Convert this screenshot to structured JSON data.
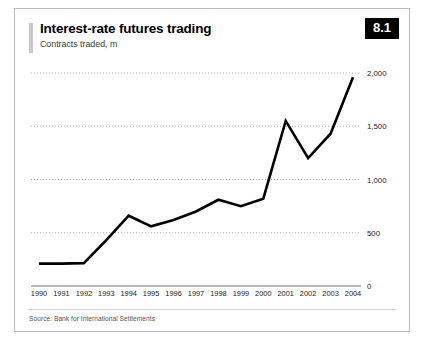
{
  "figure": {
    "badge": "8.1",
    "title": "Interest-rate futures trading",
    "subtitle": "Contracts traded, m",
    "source": "Source: Bank for International Settlements"
  },
  "chart_data": {
    "type": "line",
    "title": "Interest-rate futures trading",
    "subtitle": "Contracts traded, m",
    "xlabel": "",
    "ylabel": "Contracts traded, m",
    "ylim": [
      0,
      2000
    ],
    "yticks": [
      0,
      500,
      1000,
      1500,
      2000
    ],
    "ytick_labels": [
      "0",
      "500",
      "1,000",
      "1,500",
      "2,000"
    ],
    "grid": true,
    "gridline_style": "dotted",
    "legend": false,
    "line_color": "#000000",
    "categories": [
      "1990",
      "1991",
      "1992",
      "1993",
      "1994",
      "1995",
      "1996",
      "1997",
      "1998",
      "1999",
      "2000",
      "2001",
      "2002",
      "2003",
      "2004"
    ],
    "values": [
      210,
      210,
      215,
      430,
      660,
      560,
      620,
      700,
      810,
      750,
      820,
      1550,
      1200,
      1430,
      1960
    ]
  }
}
